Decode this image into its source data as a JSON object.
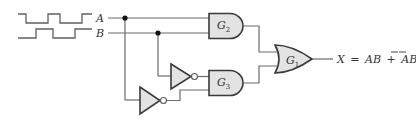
{
  "diagram": {
    "type": "logic-circuit",
    "inputs": [
      {
        "name": "A",
        "label": "A"
      },
      {
        "name": "B",
        "label": "B"
      }
    ],
    "gates": [
      {
        "id": "G2",
        "label": "G",
        "subscript": "2",
        "type": "AND",
        "inputs": [
          "A",
          "B"
        ]
      },
      {
        "id": "G3",
        "label": "G",
        "subscript": "3",
        "type": "AND",
        "inputs": [
          "NOT B",
          "NOT A"
        ]
      },
      {
        "id": "G1",
        "label": "G",
        "subscript": "1",
        "type": "OR",
        "inputs": [
          "G2",
          "G3"
        ]
      }
    ],
    "inverters": [
      {
        "id": "INV_B",
        "input": "B"
      },
      {
        "id": "INV_A",
        "input": "A"
      }
    ],
    "output": {
      "variable": "X",
      "equals": "=",
      "term1": "AB",
      "plus": "+",
      "term2_a": "A",
      "term2_b": "B",
      "term2_overbar": true,
      "full_text": "X = AB + A̅B̅"
    },
    "colors": {
      "gate_fill": "#e3e3e3",
      "gate_stroke": "#3a3a3a",
      "wire": "#6b6b6b",
      "junction": "#111111"
    }
  }
}
